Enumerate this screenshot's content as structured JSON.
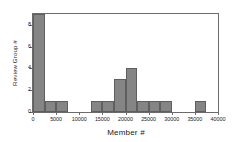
{
  "chart_data": {
    "type": "bar",
    "title": "",
    "subtitle": "",
    "xlabel": "Member #",
    "ylabel": "Review Group #",
    "xlim": [
      0,
      40000
    ],
    "ylim": [
      0,
      9
    ],
    "grid": false,
    "legend": null,
    "bin_width": 2500,
    "bar_color": "#858585",
    "bar_edge_color": "#5f5f5f",
    "axis_color": "#6b6b6b",
    "background_color": "#ffffff",
    "xticks": [
      0,
      5000,
      10000,
      15000,
      20000,
      25000,
      30000,
      35000,
      40000
    ],
    "xtick_labels": [
      "0",
      "5000",
      "10000",
      "15000",
      "20000",
      "25000",
      "30000",
      "35000",
      "40000"
    ],
    "yticks": [
      0,
      2,
      4,
      6,
      8
    ],
    "ytick_labels": [
      "0",
      "2",
      "4",
      "6",
      "8"
    ],
    "categories": [
      "0-2500",
      "2500-5000",
      "5000-7500",
      "7500-10000",
      "10000-12500",
      "12500-15000",
      "15000-17500",
      "17500-20000",
      "20000-22500",
      "22500-25000",
      "25000-27500",
      "27500-30000",
      "30000-32500",
      "32500-35000",
      "35000-37500",
      "37500-40000"
    ],
    "bins": [
      {
        "x0": 0,
        "x1": 2500,
        "value": 9
      },
      {
        "x0": 2500,
        "x1": 5000,
        "value": 1
      },
      {
        "x0": 5000,
        "x1": 7500,
        "value": 1
      },
      {
        "x0": 7500,
        "x1": 10000,
        "value": 0
      },
      {
        "x0": 10000,
        "x1": 12500,
        "value": 0
      },
      {
        "x0": 12500,
        "x1": 15000,
        "value": 1
      },
      {
        "x0": 15000,
        "x1": 17500,
        "value": 1
      },
      {
        "x0": 17500,
        "x1": 20000,
        "value": 3
      },
      {
        "x0": 20000,
        "x1": 22500,
        "value": 4
      },
      {
        "x0": 22500,
        "x1": 25000,
        "value": 1
      },
      {
        "x0": 25000,
        "x1": 27500,
        "value": 1
      },
      {
        "x0": 27500,
        "x1": 30000,
        "value": 1
      },
      {
        "x0": 30000,
        "x1": 32500,
        "value": 0
      },
      {
        "x0": 32500,
        "x1": 35000,
        "value": 0
      },
      {
        "x0": 35000,
        "x1": 37500,
        "value": 1
      },
      {
        "x0": 37500,
        "x1": 40000,
        "value": 0
      }
    ],
    "values": [
      9,
      1,
      1,
      0,
      0,
      1,
      1,
      3,
      4,
      1,
      1,
      1,
      0,
      0,
      1,
      0
    ]
  }
}
